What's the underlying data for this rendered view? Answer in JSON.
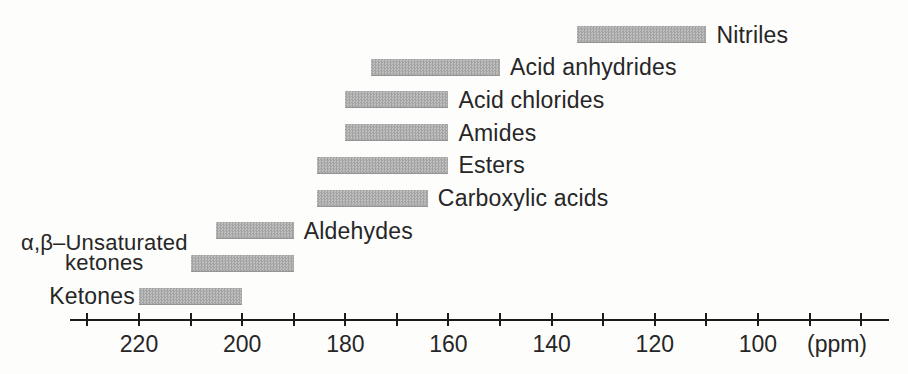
{
  "figure": {
    "background": "#fdfdfc",
    "text_color": "#262626",
    "axis_color": "#1c1c1c",
    "bar_fill_light": "#bfbfbf",
    "bar_fill_dark": "#a3a3a3"
  },
  "chart_data": {
    "type": "bar",
    "subtype": "horizontal-range-bars",
    "title": "",
    "xlabel": "(ppm)",
    "ylabel": "",
    "unit_label": "(ppm)",
    "x_axis": {
      "unit": "ppm",
      "direction": "descending-left-to-right",
      "range_shown": [
        230,
        80
      ],
      "tick_step": 10,
      "labeled_ticks": [
        220,
        200,
        180,
        160,
        140,
        120,
        100
      ],
      "grid": false
    },
    "series": [
      {
        "name": "Nitriles",
        "ppm_high": 135,
        "ppm_low": 110,
        "label_side": "right"
      },
      {
        "name": "Acid anhydrides",
        "ppm_high": 175,
        "ppm_low": 150,
        "label_side": "right"
      },
      {
        "name": "Acid chlorides",
        "ppm_high": 180,
        "ppm_low": 160,
        "label_side": "right"
      },
      {
        "name": "Amides",
        "ppm_high": 180,
        "ppm_low": 160,
        "label_side": "right"
      },
      {
        "name": "Esters",
        "ppm_high": 185.5,
        "ppm_low": 160,
        "label_side": "right"
      },
      {
        "name": "Carboxylic acids",
        "ppm_high": 185.5,
        "ppm_low": 164,
        "label_side": "right"
      },
      {
        "name": "Aldehydes",
        "ppm_high": 205,
        "ppm_low": 190,
        "label_side": "right"
      },
      {
        "name": "α,β–Unsaturated ketones",
        "ppm_high": 210,
        "ppm_low": 190,
        "label_side": "left",
        "label_lines": [
          "α,β–Unsaturated",
          "ketones"
        ]
      },
      {
        "name": "Ketones",
        "ppm_high": 220,
        "ppm_low": 200,
        "label_side": "left"
      }
    ]
  }
}
